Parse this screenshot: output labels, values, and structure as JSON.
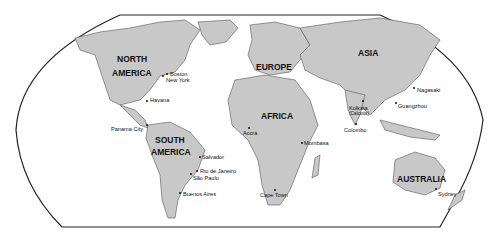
{
  "map": {
    "projection": "world political outline",
    "continents": [
      {
        "id": "north-america",
        "lines": [
          "NORTH",
          "AMERICA"
        ]
      },
      {
        "id": "south-america",
        "lines": [
          "SOUTH",
          "AMERICA"
        ]
      },
      {
        "id": "europe",
        "lines": [
          "EUROPE"
        ]
      },
      {
        "id": "africa",
        "lines": [
          "AFRICA"
        ]
      },
      {
        "id": "asia",
        "lines": [
          "ASIA"
        ]
      },
      {
        "id": "australia",
        "lines": [
          "AUSTRALIA"
        ]
      }
    ],
    "cities": [
      {
        "id": "boston",
        "name": "Boston"
      },
      {
        "id": "new-york",
        "name": "New York"
      },
      {
        "id": "havana",
        "name": "Havana"
      },
      {
        "id": "panama-city",
        "name": "Panama City"
      },
      {
        "id": "salvador",
        "name": "Salvador"
      },
      {
        "id": "rio-de-janeiro",
        "name": "Rio de Janeiro"
      },
      {
        "id": "sao-paulo",
        "name": "São Paulo"
      },
      {
        "id": "buenos-aires",
        "name": "Buenos Aires"
      },
      {
        "id": "accra",
        "name": "Accra"
      },
      {
        "id": "mombasa",
        "name": "Mombasa"
      },
      {
        "id": "cape-town",
        "name": "Cape Town"
      },
      {
        "id": "kolkata",
        "name": "Kolkata",
        "sub": "(Calcutta)"
      },
      {
        "id": "colombo",
        "name": "Colombo"
      },
      {
        "id": "guangzhou",
        "name": "Guangzhou"
      },
      {
        "id": "nagasaki",
        "name": "Nagasaki"
      },
      {
        "id": "sydney",
        "name": "Sydney"
      }
    ],
    "colors": {
      "land": "#c8c8c8",
      "ocean": "#ffffff",
      "border": "#555555",
      "frame": "#222222"
    }
  }
}
